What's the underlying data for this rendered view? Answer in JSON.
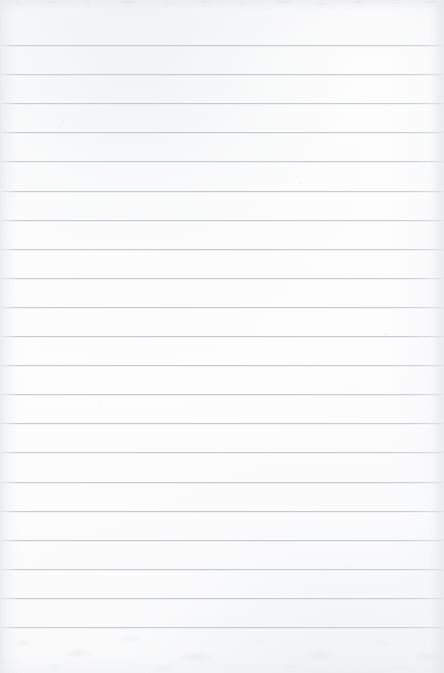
{
  "document": {
    "kind": "scanned-ruled-notebook-page",
    "title": "Blank Ruled Notebook Page",
    "width_px": 444,
    "height_px": 673,
    "orientation": "portrait",
    "text_content": "",
    "has_handwriting": false,
    "has_printed_text": false,
    "margin_rule": "none",
    "hole_punches": "none"
  },
  "paper": {
    "background_color": "#fdfdfe",
    "background_color_secondary": "#fafafb",
    "top_edge_band_color": "#f4f5f7",
    "texture": "mottled-scan-grain",
    "grain_color": "#ecedf0"
  },
  "ruling": {
    "line_color": "#c5cad1",
    "line_color_light": "#d5d9de",
    "line_thickness_px": 1,
    "line_spacing_px": 29.1,
    "first_line_y_px": 45,
    "last_line_y_px": 627,
    "line_count": 21,
    "line_start_x_px": 0,
    "line_end_x_px": 444,
    "top_margin_px": 45,
    "bottom_margin_px": 46,
    "line_y_positions": [
      45,
      74.1,
      103.2,
      132.3,
      161.4,
      190.5,
      219.6,
      248.7,
      277.8,
      306.9,
      336,
      365.1,
      394.2,
      423.3,
      452.4,
      481.5,
      510.6,
      539.7,
      568.8,
      597.9,
      627
    ]
  },
  "lighting": {
    "left_edge_shadow": "#e2e4e8",
    "right_edge_shadow": "#e6e8ec",
    "vignette_strength": "subtle"
  }
}
